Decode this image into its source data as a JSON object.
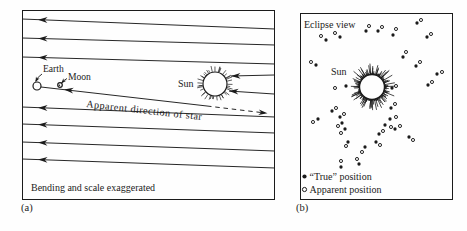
{
  "figure": {
    "colors": {
      "ink": "#1b1b1b",
      "background": "#fefefe"
    },
    "panel_a": {
      "caption": "(a)",
      "labels": {
        "earth": "Earth",
        "moon": "Moon",
        "sun": "Sun",
        "apparent_direction": "Apparent direction of star",
        "note": "Bending and scale exaggerated"
      },
      "rays": [
        [
          9,
          19
        ],
        [
          28,
          35
        ],
        [
          47,
          54
        ],
        [
          97,
          107
        ],
        [
          114,
          123
        ],
        [
          132,
          141
        ],
        [
          149,
          158
        ]
      ],
      "ray_arrow_x": 16,
      "sun_arrows": [
        {
          "tip": [
            209,
            66
          ],
          "end": [
            252,
            65
          ]
        },
        {
          "tip": [
            207,
            81
          ],
          "end": [
            252,
            84
          ]
        }
      ],
      "sight_line": {
        "solid": [
          [
            19,
            77
          ],
          [
            185,
            96
          ]
        ],
        "dashed": [
          [
            185,
            96
          ],
          [
            243,
            103
          ]
        ],
        "dash_tip": [
          245.5,
          103.3
        ],
        "head_near_earth": [
          42,
          79.6
        ]
      },
      "earth": {
        "cx": 15,
        "cy": 76,
        "r": 4
      },
      "moon": {
        "cx": 38,
        "cy": 75,
        "r": 2.3
      },
      "sun": {
        "cx": 193,
        "cy": 74,
        "r": 12
      }
    },
    "panel_b": {
      "caption": "(b)",
      "title": "Eclipse view",
      "sun_label": "Sun",
      "sun": {
        "cx": 72,
        "cy": 74,
        "r": 12.5
      },
      "stars": [
        [
          26,
          27,
          21,
          23
        ],
        [
          40,
          24,
          35,
          20
        ],
        [
          66,
          18,
          69,
          13
        ],
        [
          78,
          18,
          82,
          14
        ],
        [
          93,
          22,
          96,
          16
        ],
        [
          127,
          24,
          131,
          21
        ],
        [
          117,
          10,
          121,
          7
        ],
        [
          16,
          52,
          11,
          49
        ],
        [
          103,
          44,
          106,
          39
        ],
        [
          116,
          53,
          120,
          49
        ],
        [
          137,
          61,
          142,
          59
        ],
        [
          128,
          72,
          132,
          69
        ],
        [
          46,
          73,
          35,
          75
        ],
        [
          92,
          75,
          96,
          73
        ],
        [
          91,
          95,
          95,
          91
        ],
        [
          90,
          106,
          96,
          104
        ],
        [
          85,
          112,
          91,
          114
        ],
        [
          79,
          121,
          83,
          118
        ],
        [
          76,
          129,
          80,
          132
        ],
        [
          109,
          124,
          113,
          127
        ],
        [
          95,
          116,
          100,
          113
        ],
        [
          32,
          98,
          36,
          95
        ],
        [
          18,
          106,
          13,
          109
        ],
        [
          40,
          104,
          44,
          101
        ],
        [
          42,
          110,
          38,
          113
        ],
        [
          45,
          116,
          41,
          120
        ],
        [
          48,
          129,
          46,
          133
        ],
        [
          65,
          134,
          62,
          139
        ],
        [
          41,
          154,
          41,
          148
        ],
        [
          59,
          151,
          57,
          146
        ]
      ],
      "legend": [
        {
          "marker": "filled",
          "label": "“True” position"
        },
        {
          "marker": "open",
          "label": "Apparent position"
        }
      ]
    }
  }
}
